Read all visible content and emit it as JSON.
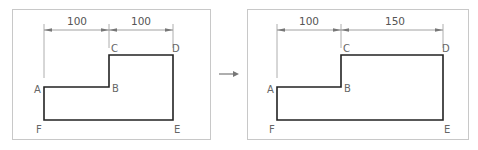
{
  "panels": [
    {
      "name": "before",
      "dimensions": [
        {
          "label": "100",
          "from": "A",
          "to": "B/C"
        },
        {
          "label": "100",
          "from": "C",
          "to": "D"
        }
      ],
      "points": {
        "A": "A",
        "B": "B",
        "C": "C",
        "D": "D",
        "E": "E",
        "F": "F"
      }
    },
    {
      "name": "after",
      "dimensions": [
        {
          "label": "100",
          "from": "A",
          "to": "B/C"
        },
        {
          "label": "150",
          "from": "C",
          "to": "D"
        }
      ],
      "points": {
        "A": "A",
        "B": "B",
        "C": "C",
        "D": "D",
        "E": "E",
        "F": "F"
      }
    }
  ],
  "transition_icon": "arrow-right-icon",
  "colors": {
    "shape": "#222222",
    "frame": "#c8c8c8",
    "dimension": "#8a8a8a",
    "label": "#666666"
  }
}
